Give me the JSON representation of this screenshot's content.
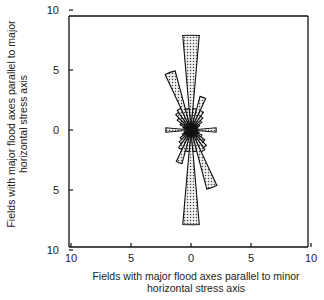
{
  "chart_data": {
    "type": "rose",
    "title": "",
    "xlabel": "Fields with major flood axes parallel to minor horizontal stress axis",
    "ylabel": "Fields with major flood axes parallel to major horizontal stress axis",
    "xlabel_lines": [
      "Fields with major flood axes parallel to minor",
      "horizontal stress axis"
    ],
    "ylabel_lines": [
      "Fields with major flood axes parallel to major",
      "horizontal stress axis"
    ],
    "x_ticks": [
      10,
      5,
      0,
      5,
      10
    ],
    "y_ticks": [
      10,
      5,
      0,
      5,
      10
    ],
    "xlim": [
      -10,
      10
    ],
    "ylim": [
      -10,
      10
    ],
    "grid": false,
    "bin_width_deg": 10,
    "symmetry": "axial",
    "angles_deg": [
      0,
      10,
      20,
      30,
      40,
      50,
      60,
      70,
      80,
      90,
      100,
      110,
      120,
      130,
      140,
      150,
      160,
      170
    ],
    "values": [
      7.9,
      1.8,
      2.9,
      1.8,
      1.4,
      1.1,
      0.8,
      0.6,
      0.5,
      2.1,
      0.5,
      0.7,
      1.0,
      1.4,
      1.8,
      2.0,
      5.1,
      1.8
    ],
    "fill_pattern": "stippled",
    "colors": {
      "fill": "#d9d9d9",
      "stroke": "#111111",
      "dots": "#333333"
    }
  }
}
